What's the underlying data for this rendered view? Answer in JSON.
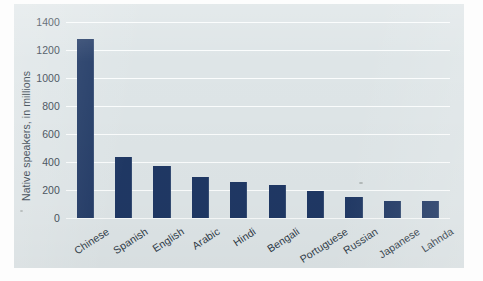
{
  "chart_data": {
    "type": "bar",
    "title": "",
    "subtitle": "",
    "xlabel": "",
    "ylabel": "Native speakers, in millions",
    "categories": [
      "Chinese",
      "Spanish",
      "English",
      "Arabic",
      "Hindi",
      "Bengali",
      "Portuguese",
      "Russian",
      "Japanese",
      "Lahnda"
    ],
    "values": [
      1280,
      435,
      370,
      290,
      255,
      235,
      195,
      150,
      125,
      120
    ],
    "ylim": [
      0,
      1400
    ],
    "ytick_labels": [
      "0",
      "200",
      "400",
      "600",
      "800",
      "1000",
      "1200",
      "1400"
    ],
    "ytick_values": [
      0,
      200,
      400,
      600,
      800,
      1000,
      1200,
      1400
    ],
    "grid": true,
    "legend": false,
    "legend_position": "none",
    "bar_color": "#1f3864",
    "plot_background": "#dee5e7",
    "gridline_color": "#fbfdfd"
  },
  "figure": {
    "card_background": "#dee5e7",
    "page_background": "#fdfdfd"
  }
}
